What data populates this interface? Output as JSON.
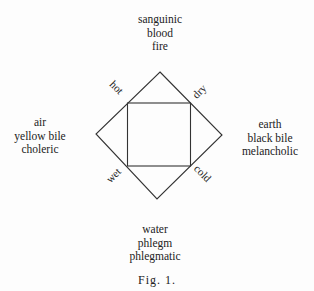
{
  "diagram": {
    "type": "four humours / four elements diagram",
    "top": {
      "lines": [
        "sanguinic",
        "blood",
        "fire"
      ]
    },
    "left": {
      "lines": [
        "air",
        "yellow bile",
        "choleric"
      ]
    },
    "right": {
      "lines": [
        "earth",
        "black bile",
        "melancholic"
      ]
    },
    "bottom": {
      "lines": [
        "water",
        "phlegm",
        "phlegmatic"
      ]
    },
    "qualities": {
      "top_left": "hot",
      "top_right": "dry",
      "bottom_left": "wet",
      "bottom_right": "cold"
    },
    "caption": "Fig. 1.",
    "line_color": "#333333"
  }
}
